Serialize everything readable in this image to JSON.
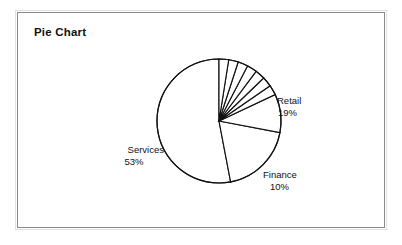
{
  "chart_title": "Pie Chart",
  "chart_data": {
    "type": "pie",
    "title": "Pie Chart",
    "unit": "%",
    "legend": "none",
    "labels_shown": [
      "Services",
      "Retail",
      "Finance"
    ],
    "categories": [
      "Services",
      "Retail",
      "Finance"
    ],
    "values": [
      53,
      19,
      10
    ],
    "slices": [
      {
        "label": "Services",
        "value": 53,
        "display_value": "53%",
        "labeled": true
      },
      {
        "label": "Retail",
        "value": 19,
        "display_value": "19%",
        "labeled": true
      },
      {
        "label": "Finance",
        "value": 10,
        "display_value": "10%",
        "labeled": true
      },
      {
        "label": "",
        "value": 2.6,
        "display_value": "",
        "labeled": false
      },
      {
        "label": "",
        "value": 2.6,
        "display_value": "",
        "labeled": false
      },
      {
        "label": "",
        "value": 2.6,
        "display_value": "",
        "labeled": false
      },
      {
        "label": "",
        "value": 2.6,
        "display_value": "",
        "labeled": false
      },
      {
        "label": "",
        "value": 2.6,
        "display_value": "",
        "labeled": false
      },
      {
        "label": "",
        "value": 2.5,
        "display_value": "",
        "labeled": false
      },
      {
        "label": "",
        "value": 2.5,
        "display_value": "",
        "labeled": false
      }
    ],
    "geometry": {
      "center_x": 201,
      "center_y": 108,
      "radius": 62,
      "start_angle_deg": -90,
      "direction": "counterclockwise"
    },
    "style": {
      "slice_fill": "#ffffff",
      "slice_stroke": "#111111",
      "frame_stroke": "#8a8a8a",
      "text_color": "#111111"
    }
  },
  "labels": {
    "retail": {
      "name": "Retail",
      "value": "19%"
    },
    "services": {
      "name": "Services",
      "value": "53%"
    },
    "finance": {
      "name": "Finance",
      "value": "10%"
    }
  }
}
